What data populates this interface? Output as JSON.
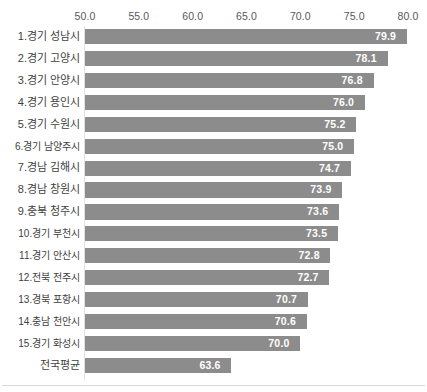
{
  "chart_data": {
    "type": "bar",
    "orientation": "horizontal",
    "title": "",
    "subtitle": "",
    "xlabel": "",
    "ylabel": "",
    "xlim": [
      50.0,
      80.0
    ],
    "xticks": [
      "50.0",
      "55.0",
      "60.0",
      "65.0",
      "70.0",
      "75.0",
      "80.0"
    ],
    "xtick_values": [
      50.0,
      55.0,
      60.0,
      65.0,
      70.0,
      75.0,
      80.0
    ],
    "grid": false,
    "legend": null,
    "axis_position": "top",
    "bar_color": "#8c8c8c",
    "value_label_color": "#ffffff",
    "categories": [
      "1.경기 성남시",
      "2.경기 고양시",
      "3.경기 안양시",
      "4.경기 용인시",
      "5.경기 수원시",
      "6.경기 남양주시",
      "7.경남 김해시",
      "8.경남 창원시",
      "9.충북 청주시",
      "10.경기 부천시",
      "11.경기 안산시",
      "12.전북 전주시",
      "13.경북 포항시",
      "14.충남 천안시",
      "15.경기 화성시",
      "전국평균"
    ],
    "values": [
      79.9,
      78.1,
      76.8,
      76.0,
      75.2,
      75.0,
      74.7,
      73.9,
      73.6,
      73.5,
      72.8,
      72.7,
      70.7,
      70.6,
      70.0,
      63.6
    ],
    "value_labels": [
      "79.9",
      "78.1",
      "76.8",
      "76.0",
      "75.2",
      "75.0",
      "74.7",
      "73.9",
      "73.6",
      "73.5",
      "72.8",
      "72.7",
      "70.7",
      "70.6",
      "70.0",
      "63.6"
    ]
  }
}
